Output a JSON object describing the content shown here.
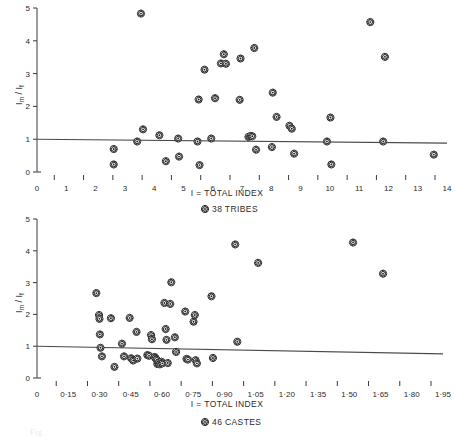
{
  "figure": {
    "background_color": "#ffffff",
    "ink_color": "#2b2b2b",
    "marker_name": "flower-marker",
    "caption_partial": "Fig."
  },
  "chart_data": [
    {
      "id": "tribes",
      "type": "scatter",
      "title": "",
      "xlabel": "I = TOTAL INDEX",
      "ylabel": "Im / If",
      "legend": "38 TRIBES",
      "legend_position": "below-axis-center",
      "grid": false,
      "xlim": [
        0,
        14
      ],
      "ylim": [
        0,
        5
      ],
      "xticks": [
        0,
        1,
        2,
        3,
        4,
        5,
        6,
        7,
        8,
        9,
        10,
        11,
        12,
        13,
        14
      ],
      "xticklabels": [
        "0",
        "1",
        "2",
        "3",
        "4",
        "5",
        "6",
        "7",
        "8",
        "9",
        "10",
        "11",
        "12",
        "13",
        "14"
      ],
      "yticks": [
        0,
        1,
        2,
        3,
        4,
        5
      ],
      "yticklabels": [
        "0",
        "1",
        "2",
        "3",
        "4",
        "5"
      ],
      "reference_line": {
        "name": "regression-line",
        "x1": 0.0,
        "y1": 1.0,
        "x2": 14.0,
        "y2": 0.88
      },
      "n_points": 38,
      "points": [
        [
          2.62,
          0.7
        ],
        [
          2.62,
          0.23
        ],
        [
          3.42,
          0.93
        ],
        [
          3.55,
          4.83
        ],
        [
          3.62,
          1.3
        ],
        [
          4.18,
          1.12
        ],
        [
          4.4,
          0.33
        ],
        [
          4.82,
          1.02
        ],
        [
          4.85,
          0.47
        ],
        [
          5.48,
          0.93
        ],
        [
          5.52,
          2.21
        ],
        [
          5.55,
          0.21
        ],
        [
          5.72,
          3.12
        ],
        [
          5.95,
          1.02
        ],
        [
          6.08,
          2.25
        ],
        [
          6.28,
          3.31
        ],
        [
          6.38,
          3.59
        ],
        [
          6.92,
          2.2
        ],
        [
          6.95,
          3.46
        ],
        [
          7.22,
          1.07
        ],
        [
          7.3,
          1.1
        ],
        [
          7.42,
          3.78
        ],
        [
          7.48,
          0.68
        ],
        [
          8.02,
          0.76
        ],
        [
          8.05,
          2.42
        ],
        [
          8.18,
          1.68
        ],
        [
          8.62,
          1.41
        ],
        [
          8.7,
          1.32
        ],
        [
          8.78,
          0.56
        ],
        [
          9.9,
          0.93
        ],
        [
          10.02,
          1.66
        ],
        [
          10.05,
          0.23
        ],
        [
          11.38,
          4.57
        ],
        [
          11.82,
          0.93
        ],
        [
          11.88,
          3.51
        ],
        [
          13.55,
          0.53
        ],
        [
          6.45,
          3.3
        ],
        [
          7.35,
          1.09
        ]
      ]
    },
    {
      "id": "castes",
      "type": "scatter",
      "title": "",
      "xlabel": "I = TOTAL INDEX",
      "ylabel": "Im / If",
      "legend": "46 CASTES",
      "legend_position": "below-axis-center",
      "grid": false,
      "xlim": [
        0,
        1.95
      ],
      "ylim": [
        0,
        5
      ],
      "xticks": [
        0,
        0.15,
        0.3,
        0.45,
        0.6,
        0.75,
        0.9,
        1.05,
        1.2,
        1.35,
        1.5,
        1.65,
        1.8,
        1.95
      ],
      "xticklabels": [
        "0",
        "0·15",
        "0·30",
        "0·45",
        "0·60",
        "0·75",
        "0·90",
        "1·05",
        "1·20",
        "1·35",
        "1·50",
        "1·65",
        "1·80",
        "1·95"
      ],
      "yticks": [
        0,
        1,
        2,
        3,
        4,
        5
      ],
      "yticklabels": [
        "0",
        "1",
        "2",
        "3",
        "4",
        "5"
      ],
      "reference_line": {
        "name": "regression-line",
        "x1": 0.0,
        "y1": 1.0,
        "x2": 1.95,
        "y2": 0.76
      },
      "n_points": 46,
      "points": [
        [
          0.285,
          2.67
        ],
        [
          0.298,
          1.98
        ],
        [
          0.3,
          1.86
        ],
        [
          0.302,
          1.37
        ],
        [
          0.305,
          0.95
        ],
        [
          0.312,
          0.68
        ],
        [
          0.355,
          1.88
        ],
        [
          0.372,
          0.35
        ],
        [
          0.408,
          1.08
        ],
        [
          0.418,
          0.68
        ],
        [
          0.445,
          1.89
        ],
        [
          0.452,
          0.62
        ],
        [
          0.462,
          0.55
        ],
        [
          0.478,
          1.45
        ],
        [
          0.482,
          0.61
        ],
        [
          0.53,
          0.72
        ],
        [
          0.538,
          0.7
        ],
        [
          0.548,
          1.35
        ],
        [
          0.552,
          1.22
        ],
        [
          0.565,
          0.66
        ],
        [
          0.57,
          0.62
        ],
        [
          0.575,
          0.57
        ],
        [
          0.578,
          0.44
        ],
        [
          0.585,
          0.48
        ],
        [
          0.59,
          0.43
        ],
        [
          0.598,
          0.51
        ],
        [
          0.602,
          0.46
        ],
        [
          0.612,
          2.36
        ],
        [
          0.618,
          1.54
        ],
        [
          0.622,
          1.2
        ],
        [
          0.628,
          0.47
        ],
        [
          0.64,
          2.33
        ],
        [
          0.645,
          3.01
        ],
        [
          0.662,
          1.28
        ],
        [
          0.668,
          0.82
        ],
        [
          0.712,
          2.09
        ],
        [
          0.718,
          0.6
        ],
        [
          0.725,
          0.58
        ],
        [
          0.752,
          1.77
        ],
        [
          0.758,
          1.98
        ],
        [
          0.762,
          0.56
        ],
        [
          0.768,
          0.46
        ],
        [
          0.838,
          2.57
        ],
        [
          0.845,
          0.63
        ],
        [
          0.952,
          4.2
        ],
        [
          0.962,
          1.14
        ],
        [
          1.062,
          3.62
        ],
        [
          1.518,
          4.26
        ],
        [
          1.662,
          3.28
        ]
      ]
    }
  ]
}
